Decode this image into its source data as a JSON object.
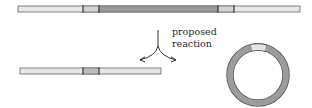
{
  "diagram": {
    "label_line1": "proposed",
    "label_line2": "reaction",
    "elements": {
      "top_linear_dna": "linear DNA with marked region and flanking segments",
      "bottom_linear_dna": "linear DNA product with single marked segment",
      "circular_dna": "circular DNA product with light segment at top"
    },
    "colors": {
      "strand_outline": "#555555",
      "strand_light": "#e6e6e6",
      "segment_light": "#d9d9d9",
      "segment_dark": "#9a9a9a",
      "ring": "#999999",
      "arrow": "#333333"
    }
  }
}
